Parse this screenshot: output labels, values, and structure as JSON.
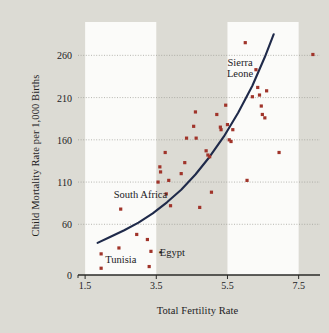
{
  "chart_data": {
    "type": "scatter",
    "title": "",
    "xlabel": "Total Fertility Rate",
    "ylabel": "Child Mortality Rate per 1,000 Births",
    "xlim": [
      1.3,
      8.1
    ],
    "ylim": [
      0,
      290
    ],
    "xticks": [
      "1.5",
      "3.5",
      "5.5",
      "7.5"
    ],
    "xtick_values": [
      1.5,
      3.5,
      5.5,
      7.5
    ],
    "yticks": [
      "0",
      "60",
      "110",
      "160",
      "210",
      "260"
    ],
    "ytick_values": [
      0,
      60,
      110,
      160,
      210,
      260
    ],
    "grid": "horizontal-dotted",
    "legend": "none",
    "marker_color": "#a0342a",
    "curve_color": "#1f2a4a",
    "background_color": "#dcdbd4",
    "band_color": "#fbfbf9",
    "bands": [
      [
        1.5,
        3.5
      ],
      [
        5.5,
        7.5
      ]
    ],
    "points": [
      [
        1.95,
        25
      ],
      [
        1.95,
        8
      ],
      [
        2.45,
        32
      ],
      [
        2.95,
        48
      ],
      [
        2.5,
        78
      ],
      [
        3.25,
        42
      ],
      [
        3.3,
        10
      ],
      [
        3.35,
        28
      ],
      [
        3.55,
        110
      ],
      [
        3.6,
        128
      ],
      [
        3.62,
        122
      ],
      [
        3.75,
        145
      ],
      [
        3.78,
        96
      ],
      [
        3.85,
        112
      ],
      [
        3.9,
        82
      ],
      [
        4.2,
        120
      ],
      [
        4.3,
        133
      ],
      [
        4.35,
        162
      ],
      [
        4.55,
        176
      ],
      [
        4.6,
        193
      ],
      [
        4.62,
        162
      ],
      [
        4.72,
        80
      ],
      [
        4.9,
        147
      ],
      [
        4.95,
        142
      ],
      [
        5.0,
        140
      ],
      [
        5.05,
        98
      ],
      [
        5.2,
        190
      ],
      [
        5.3,
        175
      ],
      [
        5.32,
        172
      ],
      [
        5.45,
        201
      ],
      [
        5.5,
        178
      ],
      [
        5.55,
        160
      ],
      [
        5.6,
        158
      ],
      [
        5.65,
        172
      ],
      [
        6.0,
        275
      ],
      [
        6.05,
        112
      ],
      [
        6.2,
        211
      ],
      [
        6.3,
        243
      ],
      [
        6.35,
        222
      ],
      [
        6.4,
        213
      ],
      [
        6.45,
        200
      ],
      [
        6.48,
        190
      ],
      [
        6.55,
        186
      ],
      [
        6.6,
        218
      ],
      [
        6.95,
        145
      ],
      [
        7.9,
        261
      ]
    ],
    "curve_points": [
      [
        1.85,
        38
      ],
      [
        2.2,
        45
      ],
      [
        2.6,
        53
      ],
      [
        3.0,
        62
      ],
      [
        3.4,
        73
      ],
      [
        3.8,
        86
      ],
      [
        4.2,
        101
      ],
      [
        4.6,
        119
      ],
      [
        5.0,
        140
      ],
      [
        5.4,
        164
      ],
      [
        5.8,
        192
      ],
      [
        6.2,
        224
      ],
      [
        6.55,
        258
      ],
      [
        6.8,
        285
      ]
    ],
    "annotations": [
      {
        "name": "sierra-leone",
        "text": "Sierra\nLeone",
        "x": 5.85,
        "y": 245,
        "align": "center"
      },
      {
        "name": "south-africa",
        "text": "South Africa",
        "x": 3.05,
        "y": 95,
        "align": "center"
      },
      {
        "name": "tunisia",
        "text": "Tunisia",
        "x": 2.5,
        "y": 18,
        "align": "center"
      },
      {
        "name": "egypt",
        "text": "Egypt",
        "x": 3.95,
        "y": 26,
        "align": "center"
      },
      {
        "name": "egypt-marker-dot",
        "text": "•",
        "x": 3.62,
        "y": 26,
        "align": "center"
      }
    ]
  }
}
